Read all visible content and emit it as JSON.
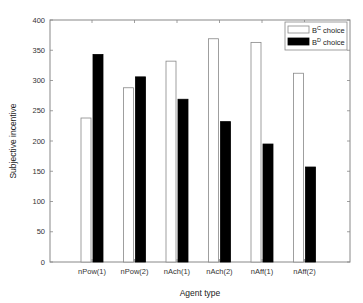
{
  "chart_data": {
    "type": "bar",
    "title": "",
    "xlabel": "Agent type",
    "ylabel": "Subjective incentive",
    "ylim": [
      0,
      400
    ],
    "yticks": [
      0,
      50,
      100,
      150,
      200,
      250,
      300,
      350,
      400
    ],
    "grid": false,
    "legend_position": "top-right",
    "categories": [
      "nPow(1)",
      "nPow(2)",
      "nAch(1)",
      "nAch(2)",
      "nAff(1)",
      "nAff(2)"
    ],
    "series": [
      {
        "name": "B^C choice",
        "base": "B",
        "sup": "C",
        "suffix": " choice",
        "fill": "#ffffff",
        "stroke": "#888888",
        "values": [
          238,
          288,
          332,
          369,
          363,
          312
        ]
      },
      {
        "name": "B^D choice",
        "base": "B",
        "sup": "D",
        "suffix": " choice",
        "fill": "#000000",
        "stroke": "#000000",
        "values": [
          343,
          306,
          269,
          232,
          195,
          157
        ]
      }
    ]
  }
}
